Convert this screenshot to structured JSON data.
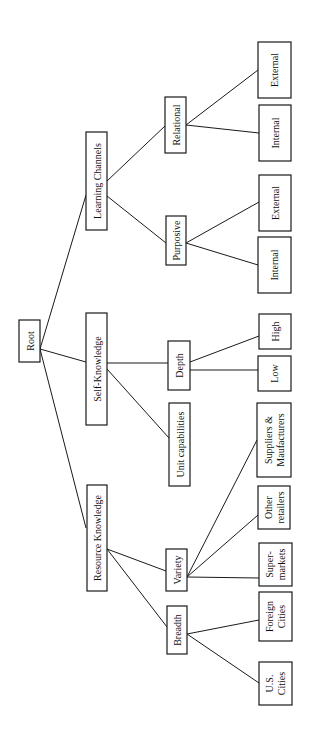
{
  "diagram": {
    "type": "tree",
    "orientation": "rotated-90-ccw",
    "colors": {
      "stroke": "#1a1a1a",
      "text": "#111111",
      "background": "#ffffff"
    },
    "nodes": {
      "root": {
        "lines": [
          "Root"
        ]
      },
      "learning_channels": {
        "lines": [
          "Learning Channels"
        ]
      },
      "self_knowledge": {
        "lines": [
          "Self-Knowledge"
        ]
      },
      "resource_knowledge": {
        "lines": [
          "Resource Knowledge"
        ]
      },
      "relational": {
        "lines": [
          "Relational"
        ]
      },
      "purposive": {
        "lines": [
          "Purposive"
        ]
      },
      "depth": {
        "lines": [
          "Depth"
        ]
      },
      "unit_capabilities": {
        "lines": [
          "Unit capabilities"
        ]
      },
      "variety": {
        "lines": [
          "Variety"
        ]
      },
      "breadth": {
        "lines": [
          "Breadth"
        ]
      },
      "relational_external": {
        "lines": [
          "External"
        ]
      },
      "relational_internal": {
        "lines": [
          "Internal"
        ]
      },
      "purposive_external": {
        "lines": [
          "External"
        ]
      },
      "purposive_internal": {
        "lines": [
          "Internal"
        ]
      },
      "depth_high": {
        "lines": [
          "High"
        ]
      },
      "depth_low": {
        "lines": [
          "Low"
        ]
      },
      "suppliers": {
        "lines": [
          "Suppliers &",
          "Maufacturers"
        ]
      },
      "other_retailers": {
        "lines": [
          "Other",
          "retailers"
        ]
      },
      "supermarkets": {
        "lines": [
          "Super-",
          "markets"
        ]
      },
      "foreign_cities": {
        "lines": [
          "Foreign",
          "Cities"
        ]
      },
      "us_cities": {
        "lines": [
          "U.S.",
          "Cities"
        ]
      }
    },
    "edges": [
      [
        "root",
        "learning_channels"
      ],
      [
        "root",
        "self_knowledge"
      ],
      [
        "root",
        "resource_knowledge"
      ],
      [
        "learning_channels",
        "relational"
      ],
      [
        "learning_channels",
        "purposive"
      ],
      [
        "relational",
        "relational_external"
      ],
      [
        "relational",
        "relational_internal"
      ],
      [
        "purposive",
        "purposive_external"
      ],
      [
        "purposive",
        "purposive_internal"
      ],
      [
        "self_knowledge",
        "depth"
      ],
      [
        "self_knowledge",
        "unit_capabilities"
      ],
      [
        "depth",
        "depth_high"
      ],
      [
        "depth",
        "depth_low"
      ],
      [
        "resource_knowledge",
        "variety"
      ],
      [
        "resource_knowledge",
        "breadth"
      ],
      [
        "variety",
        "suppliers"
      ],
      [
        "variety",
        "other_retailers"
      ],
      [
        "variety",
        "supermarkets"
      ],
      [
        "breadth",
        "foreign_cities"
      ],
      [
        "breadth",
        "us_cities"
      ]
    ]
  }
}
